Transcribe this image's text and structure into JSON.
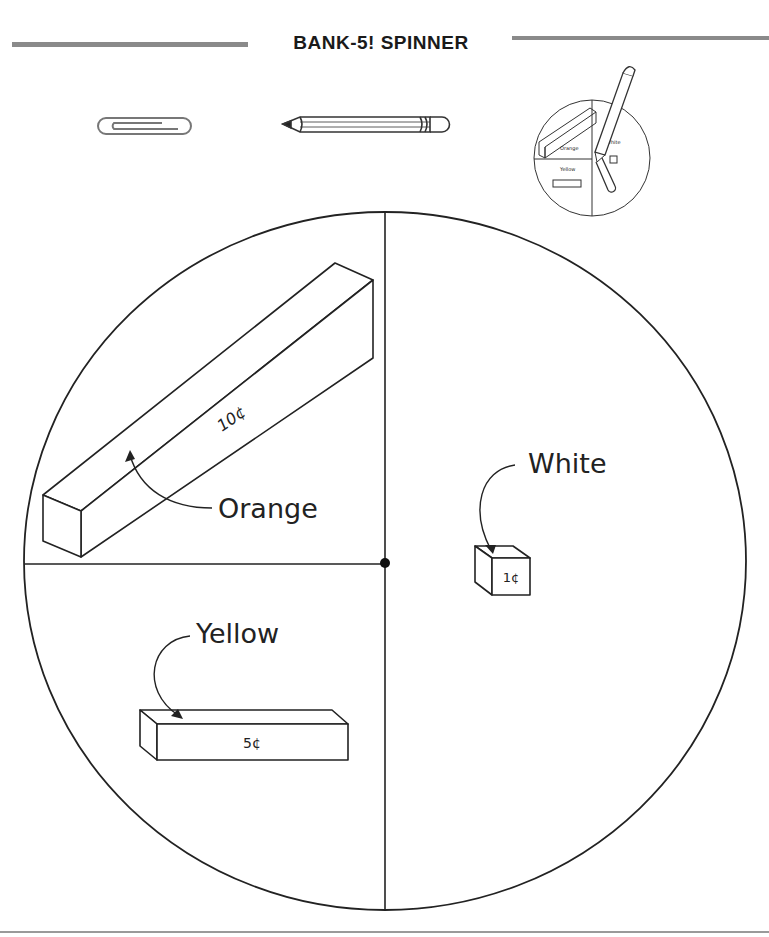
{
  "page": {
    "title": "BANK-5! SPINNER"
  },
  "materials": {
    "items": [
      {
        "name": "paper-clip",
        "label": "Paper clip"
      },
      {
        "name": "pencil",
        "label": "Pencil"
      },
      {
        "name": "assembled-spinner-preview",
        "label": "Assembled spinner example"
      }
    ],
    "preview_labels": {
      "orange": "Orange",
      "white": "White",
      "yellow": "Yellow"
    }
  },
  "spinner": {
    "sections": [
      {
        "id": "orange",
        "label": "Orange",
        "value": "10¢",
        "rod": "long rod",
        "quadrant": "top-left"
      },
      {
        "id": "white",
        "label": "White",
        "value": "1¢",
        "rod": "unit cube",
        "quadrant": "right-half"
      },
      {
        "id": "yellow",
        "label": "Yellow",
        "value": "5¢",
        "rod": "five rod",
        "quadrant": "bottom-left"
      }
    ]
  },
  "colors": {
    "ink": "#1a1a1a",
    "rule": "#8a8a8a",
    "background": "#ffffff"
  }
}
